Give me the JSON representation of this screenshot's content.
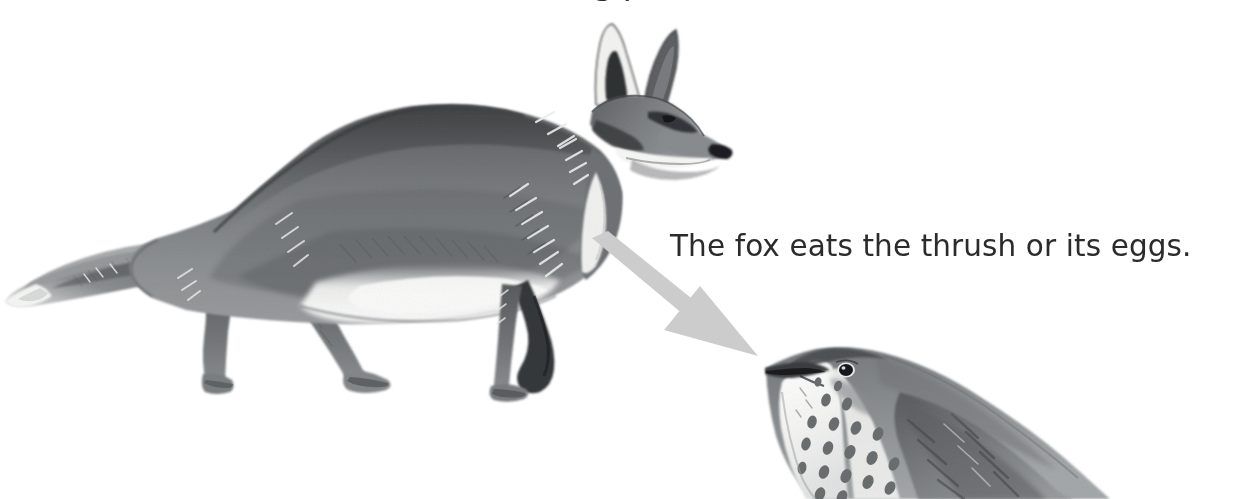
{
  "page": {
    "width": 1236,
    "height": 499,
    "background_color": "#ffffff",
    "kind": "illustration-with-caption"
  },
  "title_fragment": {
    "visible_note": "only descender pixels of a cropped headline are visible at the very top edge",
    "text": "g                                p"
  },
  "caption": {
    "text": "The fox eats the thrush or its eggs.",
    "color": "#2b2b2b",
    "x": 672,
    "y": 262
  },
  "arrow": {
    "name": "relationship-arrow",
    "color": "#cccccc",
    "direction": "down-right",
    "from": {
      "x": 595,
      "y": 243
    },
    "to": {
      "x": 758,
      "y": 356
    },
    "meaning": "fox preys on thrush"
  },
  "illustrations": [
    {
      "name": "fox",
      "label": "fox",
      "style": "grayscale watercolour and ink",
      "facing": "right",
      "bounds": {
        "x": 4,
        "y": 22,
        "width": 720,
        "height": 372
      },
      "features": [
        "pointed ears",
        "white-tipped bushy tail",
        "white muzzle",
        "dark nose",
        "four legs walking"
      ]
    },
    {
      "name": "thrush",
      "label": "thrush",
      "style": "grayscale watercolour and ink",
      "facing": "left",
      "bounds": {
        "x": 760,
        "y": 346,
        "width": 400,
        "height": 153
      },
      "cropped": "bottom edge",
      "features": [
        "spotted breast",
        "dark eye",
        "pointed beak",
        "mottled wing"
      ]
    }
  ],
  "colors": {
    "ink_dark": "#2f3032",
    "fur_mid": "#7d7f81",
    "fur_light": "#b7b9ba",
    "highlight": "#f2f2f0",
    "arrow_gray": "#cccccc",
    "text": "#2b2b2b"
  }
}
